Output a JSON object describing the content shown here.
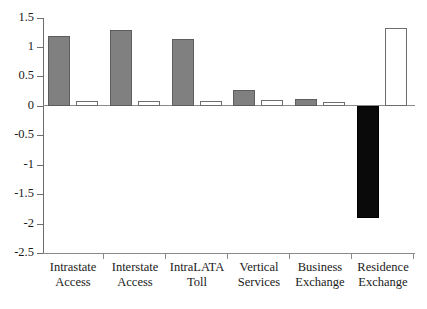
{
  "chart_data": {
    "type": "bar",
    "title": "",
    "subtitle": "",
    "xlabel": "",
    "ylabel": "",
    "ylim": [
      -2.5,
      1.5
    ],
    "ytick_labels": [
      "1.5",
      "1",
      "0.5",
      "0",
      "-0.5",
      "-1",
      "-1.5",
      "-2",
      "-2.5"
    ],
    "ytick_values": [
      1.5,
      1.0,
      0.5,
      0.0,
      -0.5,
      -1.0,
      -1.5,
      -2.0,
      -2.5
    ],
    "grid": false,
    "legend": "none",
    "categories": [
      "Intrastate Access",
      "Interstate Access",
      "IntraLATA Toll",
      "Vertical Services",
      "Business Exchange",
      "Residence Exchange"
    ],
    "category_lines": [
      [
        "Intrastate",
        "Access"
      ],
      [
        "Interstate",
        "Access"
      ],
      [
        "IntraLATA",
        "Toll"
      ],
      [
        "Vertical",
        "Services"
      ],
      [
        "Business",
        "Exchange"
      ],
      [
        "Residence",
        "Exchange"
      ]
    ],
    "series": [
      {
        "name": "series-1",
        "values": [
          1.2,
          1.3,
          1.15,
          0.27,
          0.12,
          -1.9
        ],
        "colors": [
          "#808080",
          "#808080",
          "#808080",
          "#808080",
          "#808080",
          "#000000"
        ]
      },
      {
        "name": "series-2",
        "values": [
          0.09,
          0.09,
          0.08,
          0.1,
          0.07,
          1.33
        ],
        "colors": [
          "#ffffff",
          "#ffffff",
          "#ffffff",
          "#ffffff",
          "#ffffff",
          "#ffffff"
        ]
      }
    ],
    "colors": {
      "series1_fill": "#808080",
      "series1_negative_fill": "#000000",
      "series2_fill": "#ffffff",
      "bar_stroke": "#5d5d5d",
      "axis": "#8a8a8a",
      "text": "#1a1a1a",
      "background": "#ffffff"
    }
  }
}
